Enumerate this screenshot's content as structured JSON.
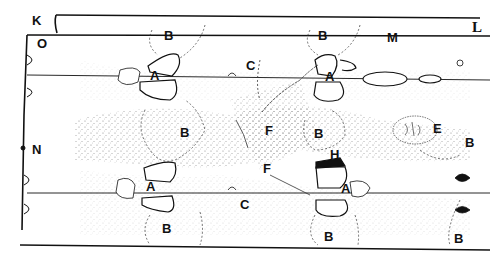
{
  "labels": {
    "K": "K",
    "O": "O",
    "L": "L",
    "M": "M",
    "N": "N",
    "B1": "B",
    "B2": "B",
    "B3": "B",
    "B4": "B",
    "B5": "B",
    "B6": "B",
    "B7": "B",
    "B8": "B",
    "A1": "A",
    "A2": "A",
    "A3": "A",
    "A4": "A",
    "C1": "C",
    "C2": "C",
    "F1": "F",
    "F2": "F",
    "E": "E",
    "H": "H"
  },
  "colors": {
    "ink": "#111111",
    "stipple": "#555555",
    "background": "#ffffff"
  }
}
